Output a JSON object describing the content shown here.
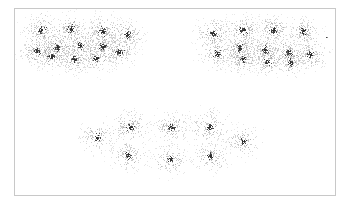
{
  "figure": {
    "title": "",
    "background_color": "#ffffff",
    "border_color": "#c8c8c8",
    "point_color": "#2b2b2b",
    "halo_color": "#8c8c8c"
  },
  "chart_data": {
    "type": "scatter",
    "title": "",
    "subtitle": "",
    "xlabel": "",
    "ylabel": "",
    "xlim": [
      0,
      322
    ],
    "ylim": [
      0,
      188
    ],
    "grid": false,
    "legend": null,
    "axis_ticks_visible": false,
    "axis_labels_visible": false,
    "point_style": {
      "marker": "dot",
      "size_px": 1,
      "core_color": "#2b2b2b",
      "halo_color": "#8c8c8c",
      "core_points_per_cluster": 26,
      "halo_points_per_cluster": 150,
      "core_sigma_px": 1.6,
      "halo_sigma_px": 13
    },
    "groups": [
      {
        "name": "upper-left-group",
        "cluster_count": 9,
        "bounds": [
          18,
          10,
          130,
          70
        ]
      },
      {
        "name": "upper-right-group",
        "cluster_count": 9,
        "bounds": [
          188,
          10,
          130,
          70
        ]
      },
      {
        "name": "lower-centre-group",
        "cluster_count": 7,
        "bounds": [
          85,
          105,
          160,
          70
        ]
      }
    ],
    "clusters": [
      {
        "group": "upper-left-group",
        "x": 26,
        "y": 21,
        "n_core": 30,
        "n_halo": 170,
        "spread": 13
      },
      {
        "group": "upper-left-group",
        "x": 56,
        "y": 20,
        "n_core": 28,
        "n_halo": 165,
        "spread": 13
      },
      {
        "group": "upper-left-group",
        "x": 87,
        "y": 22,
        "n_core": 30,
        "n_halo": 180,
        "spread": 14
      },
      {
        "group": "upper-left-group",
        "x": 112,
        "y": 25,
        "n_core": 24,
        "n_halo": 150,
        "spread": 12
      },
      {
        "group": "upper-left-group",
        "x": 22,
        "y": 42,
        "n_core": 26,
        "n_halo": 160,
        "spread": 13
      },
      {
        "group": "upper-left-group",
        "x": 42,
        "y": 38,
        "n_core": 28,
        "n_halo": 170,
        "spread": 13
      },
      {
        "group": "upper-left-group",
        "x": 36,
        "y": 47,
        "n_core": 22,
        "n_halo": 140,
        "spread": 12
      },
      {
        "group": "upper-left-group",
        "x": 65,
        "y": 36,
        "n_core": 30,
        "n_halo": 175,
        "spread": 14
      },
      {
        "group": "upper-left-group",
        "x": 59,
        "y": 50,
        "n_core": 22,
        "n_halo": 145,
        "spread": 12
      },
      {
        "group": "upper-left-group",
        "x": 88,
        "y": 37,
        "n_core": 28,
        "n_halo": 170,
        "spread": 13
      },
      {
        "group": "upper-left-group",
        "x": 81,
        "y": 49,
        "n_core": 22,
        "n_halo": 145,
        "spread": 12
      },
      {
        "group": "upper-left-group",
        "x": 104,
        "y": 43,
        "n_core": 26,
        "n_halo": 160,
        "spread": 13
      },
      {
        "group": "upper-right-group",
        "x": 198,
        "y": 24,
        "n_core": 26,
        "n_halo": 165,
        "spread": 13
      },
      {
        "group": "upper-right-group",
        "x": 228,
        "y": 21,
        "n_core": 28,
        "n_halo": 170,
        "spread": 13
      },
      {
        "group": "upper-right-group",
        "x": 258,
        "y": 21,
        "n_core": 28,
        "n_halo": 170,
        "spread": 13
      },
      {
        "group": "upper-right-group",
        "x": 288,
        "y": 22,
        "n_core": 24,
        "n_halo": 150,
        "spread": 12
      },
      {
        "group": "upper-right-group",
        "x": 202,
        "y": 44,
        "n_core": 24,
        "n_halo": 155,
        "spread": 13
      },
      {
        "group": "upper-right-group",
        "x": 224,
        "y": 39,
        "n_core": 28,
        "n_halo": 170,
        "spread": 14
      },
      {
        "group": "upper-right-group",
        "x": 228,
        "y": 50,
        "n_core": 22,
        "n_halo": 145,
        "spread": 12
      },
      {
        "group": "upper-right-group",
        "x": 250,
        "y": 41,
        "n_core": 28,
        "n_halo": 175,
        "spread": 14
      },
      {
        "group": "upper-right-group",
        "x": 252,
        "y": 52,
        "n_core": 20,
        "n_halo": 135,
        "spread": 12
      },
      {
        "group": "upper-right-group",
        "x": 273,
        "y": 43,
        "n_core": 24,
        "n_halo": 155,
        "spread": 13
      },
      {
        "group": "upper-right-group",
        "x": 275,
        "y": 53,
        "n_core": 20,
        "n_halo": 135,
        "spread": 12
      },
      {
        "group": "upper-right-group",
        "x": 295,
        "y": 45,
        "n_core": 24,
        "n_halo": 150,
        "spread": 13
      },
      {
        "group": "lower-centre-group",
        "x": 82,
        "y": 128,
        "n_core": 18,
        "n_halo": 130,
        "spread": 13
      },
      {
        "group": "lower-centre-group",
        "x": 115,
        "y": 118,
        "n_core": 26,
        "n_halo": 165,
        "spread": 14
      },
      {
        "group": "lower-centre-group",
        "x": 113,
        "y": 146,
        "n_core": 22,
        "n_halo": 150,
        "spread": 13
      },
      {
        "group": "lower-centre-group",
        "x": 156,
        "y": 118,
        "n_core": 24,
        "n_halo": 155,
        "spread": 13
      },
      {
        "group": "lower-centre-group",
        "x": 155,
        "y": 150,
        "n_core": 22,
        "n_halo": 150,
        "spread": 13
      },
      {
        "group": "lower-centre-group",
        "x": 194,
        "y": 118,
        "n_core": 28,
        "n_halo": 175,
        "spread": 15
      },
      {
        "group": "lower-centre-group",
        "x": 195,
        "y": 147,
        "n_core": 24,
        "n_halo": 155,
        "spread": 13
      },
      {
        "group": "lower-centre-group",
        "x": 228,
        "y": 132,
        "n_core": 18,
        "n_halo": 130,
        "spread": 13
      }
    ],
    "outliers": [
      {
        "name": "right-edge-outlier",
        "x": 311,
        "y": 28
      }
    ]
  }
}
